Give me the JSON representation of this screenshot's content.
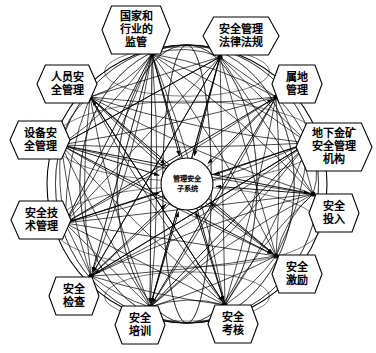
{
  "diagram": {
    "title": "管理安全子系统",
    "type": "sphere-network-diagram",
    "center": {
      "name": "center-node",
      "lines": [
        "管理安全",
        "子系统"
      ],
      "cx": 187,
      "cy": 184,
      "r": 26
    },
    "colors": {
      "background": "#ffffff",
      "stroke": "#000000",
      "node_fill": "#ffffff",
      "arc": "#111111"
    },
    "sphere": {
      "cx": 187,
      "cy": 184,
      "rx": 140,
      "ry": 139,
      "meridian_count": 9,
      "parallel_count": 5
    },
    "nodes": [
      {
        "id": "node-0",
        "name": "guojia-hangye-jianguan",
        "lines": [
          "国家和",
          "行业的",
          "监管"
        ],
        "anchor_x": 152,
        "anchor_y": 54,
        "label_x": 136,
        "label_y": 30,
        "hex_w": 68,
        "hex_h": 48
      },
      {
        "id": "node-1",
        "name": "anquan-guanli-falu-fagui",
        "lines": [
          "安全管理",
          "法律法规"
        ],
        "anchor_x": 220,
        "anchor_y": 57,
        "label_x": 241,
        "label_y": 36,
        "hex_w": 76,
        "hex_h": 38
      },
      {
        "id": "node-2",
        "name": "renyuan-anquan-guanli",
        "lines": [
          "人员安",
          "全管理"
        ],
        "anchor_x": 90,
        "anchor_y": 97,
        "label_x": 67,
        "label_y": 84,
        "hex_w": 60,
        "hex_h": 38
      },
      {
        "id": "node-3",
        "name": "shudi-guanli",
        "lines": [
          "属地",
          "管理"
        ],
        "anchor_x": 276,
        "anchor_y": 97,
        "label_x": 297,
        "label_y": 84,
        "hex_w": 50,
        "hex_h": 38
      },
      {
        "id": "node-4",
        "name": "shebei-anquan-guanli",
        "lines": [
          "设备安",
          "全管理"
        ],
        "anchor_x": 61,
        "anchor_y": 145,
        "label_x": 40,
        "label_y": 140,
        "hex_w": 60,
        "hex_h": 38
      },
      {
        "id": "node-5",
        "name": "dixia-jinkuang-anquan-guanli-jigou",
        "lines": [
          "地下金矿",
          "安全管理",
          "机构"
        ],
        "anchor_x": 308,
        "anchor_y": 143,
        "label_x": 334,
        "label_y": 147,
        "hex_w": 76,
        "hex_h": 48
      },
      {
        "id": "node-6",
        "name": "anquan-jishu-guanli",
        "lines": [
          "安全技",
          "术管理"
        ],
        "anchor_x": 65,
        "anchor_y": 223,
        "label_x": 41,
        "label_y": 220,
        "hex_w": 60,
        "hex_h": 38
      },
      {
        "id": "node-7",
        "name": "anquan-touru",
        "lines": [
          "安全",
          "投入"
        ],
        "anchor_x": 313,
        "anchor_y": 194,
        "label_x": 334,
        "label_y": 213,
        "hex_w": 50,
        "hex_h": 38
      },
      {
        "id": "node-8",
        "name": "anquan-jili",
        "lines": [
          "安全",
          "激励"
        ],
        "anchor_x": 276,
        "anchor_y": 256,
        "label_x": 297,
        "label_y": 274,
        "hex_w": 50,
        "hex_h": 38
      },
      {
        "id": "node-9",
        "name": "anquan-jiancha",
        "lines": [
          "安全",
          "检查"
        ],
        "anchor_x": 91,
        "anchor_y": 276,
        "label_x": 74,
        "label_y": 296,
        "hex_w": 50,
        "hex_h": 38
      },
      {
        "id": "node-10",
        "name": "anquan-peixun",
        "lines": [
          "安全",
          "培训"
        ],
        "anchor_x": 150,
        "anchor_y": 307,
        "label_x": 140,
        "label_y": 325,
        "hex_w": 50,
        "hex_h": 38
      },
      {
        "id": "node-11",
        "name": "anquan-kaohe",
        "lines": [
          "安全",
          "考核"
        ],
        "anchor_x": 225,
        "anchor_y": 305,
        "label_x": 233,
        "label_y": 324,
        "hex_w": 50,
        "hex_h": 38
      }
    ]
  }
}
